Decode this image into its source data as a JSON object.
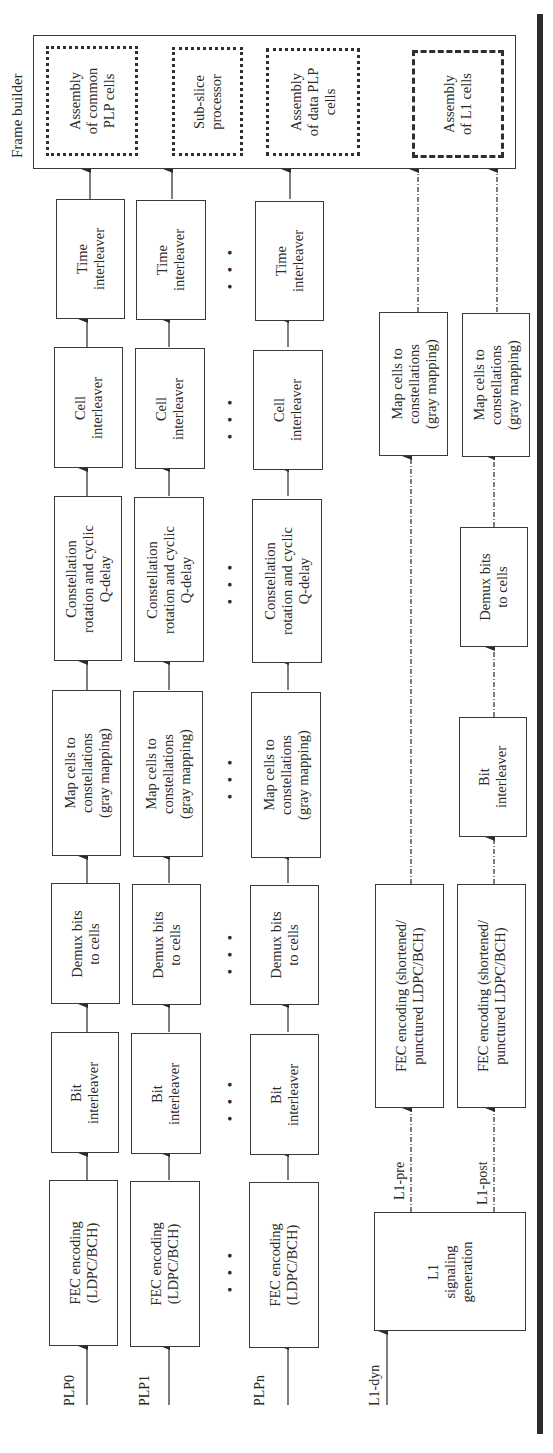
{
  "frame_builder": {
    "title": "Frame builder",
    "blocks": [
      {
        "id": "common",
        "label": "Assembly\nof common\nPLP cells",
        "style": "dotted"
      },
      {
        "id": "subslice",
        "label": "Sub-slice\nprocessor",
        "style": "dotted"
      },
      {
        "id": "data",
        "label": "Assembly\nof data PLP\ncells",
        "style": "dotted"
      },
      {
        "id": "l1",
        "label": "Assembly\nof L1 cells",
        "style": "dash-dot"
      }
    ]
  },
  "plp_chains": [
    {
      "input": "PLP0"
    },
    {
      "input": "PLP1"
    },
    {
      "input": "PLPn"
    }
  ],
  "plp_stages": {
    "fec": "FEC encoding\n(LDPC/BCH)",
    "bit_interleaver": "Bit\ninterleaver",
    "demux": "Demux bits\nto cells",
    "map": "Map cells to\nconstellations\n(gray mapping)",
    "rotation": "Constellation\nrotation and cyclic\nQ-delay",
    "cell_interleaver": "Cell\ninterleaver",
    "time_interleaver": "Time\ninterleaver"
  },
  "ellipsis": "• • •",
  "l1_chain": {
    "input": "L1-dyn",
    "generator": "L1\nsignaling\ngeneration",
    "pre": {
      "label": "L1-pre",
      "fec": "FEC encoding (shortened/\npunctured LDPC/BCH)",
      "map": "Map cells to\nconstellations\n(gray mapping)"
    },
    "post": {
      "label": "L1-post",
      "fec": "FEC encoding (shortened/\npunctured LDPC/BCH)",
      "bit_interleaver": "Bit\ninterleaver",
      "demux": "Demux bits\nto cells",
      "map": "Map cells to\nconstellations\n(gray mapping)"
    }
  },
  "colors": {
    "line": "#3a3a3a",
    "thick_bar": "#2c2c2c",
    "background": "#ffffff"
  }
}
